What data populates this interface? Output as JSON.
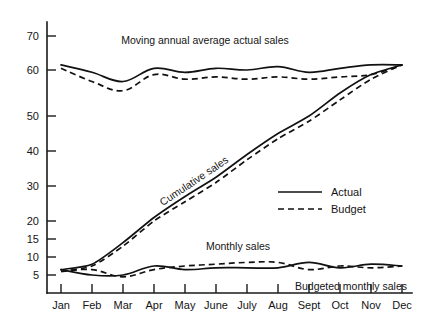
{
  "chart_data": {
    "type": "line",
    "title": "",
    "subtitle": "",
    "xlabel": "",
    "ylabel": "",
    "grid": false,
    "legend_position": "center-right",
    "categories": [
      "Jan",
      "Feb",
      "Mar",
      "Apr",
      "May",
      "June",
      "July",
      "Aug",
      "Sept",
      "Oct",
      "Nov",
      "Dec"
    ],
    "x": [
      1,
      2,
      3,
      4,
      5,
      6,
      7,
      8,
      9,
      10,
      11,
      12
    ],
    "ylim": [
      0,
      73
    ],
    "y_ticks": [
      5,
      10,
      15,
      20,
      30,
      40,
      50,
      60,
      70
    ],
    "y_tick_labels": [
      "5",
      "10",
      "15",
      "20",
      "30",
      "40",
      "50",
      "60",
      "70"
    ],
    "y_axis_scale_note": "piecewise: 5-unit steps below 20, 10-unit steps above 20",
    "series": [
      {
        "name": "Moving annual average actual sales",
        "group": "moving-annual-average",
        "style": "Actual",
        "line": "solid",
        "values": [
          61.5,
          59.5,
          57.5,
          60.5,
          59.5,
          60.5,
          60.0,
          61.0,
          59.5,
          60.5,
          61.5,
          61.5
        ]
      },
      {
        "name": "Moving annual average budget sales",
        "group": "moving-annual-average",
        "style": "Budget",
        "line": "dashed",
        "values": [
          60.5,
          57.5,
          55.5,
          59.0,
          58.0,
          58.5,
          58.0,
          58.5,
          58.0,
          58.5,
          59.0,
          61.5
        ]
      },
      {
        "name": "Cumulative actual sales",
        "group": "cumulative",
        "style": "Actual",
        "line": "solid",
        "values": [
          6.5,
          8.0,
          14.0,
          21.0,
          27.0,
          32.5,
          39.0,
          45.0,
          50.0,
          55.0,
          59.0,
          61.5
        ]
      },
      {
        "name": "Cumulative budget sales",
        "group": "cumulative",
        "style": "Budget",
        "line": "dashed",
        "values": [
          6.0,
          7.5,
          13.0,
          20.0,
          25.5,
          31.0,
          37.5,
          43.5,
          48.5,
          53.5,
          58.0,
          61.5
        ]
      },
      {
        "name": "Monthly sales",
        "group": "monthly",
        "style": "Actual",
        "line": "solid",
        "values": [
          6.5,
          5.0,
          5.0,
          7.5,
          6.5,
          7.0,
          7.0,
          7.0,
          8.5,
          7.0,
          8.0,
          7.5
        ]
      },
      {
        "name": "Budgeted monthly sales",
        "group": "monthly",
        "style": "Budget",
        "line": "dashed",
        "values": [
          6.0,
          6.5,
          4.5,
          6.5,
          7.5,
          8.0,
          8.5,
          8.5,
          6.5,
          7.5,
          7.0,
          7.5
        ]
      }
    ],
    "annotations": [
      {
        "id": "moving-annual-average-label",
        "text": "Moving annual average actual sales",
        "x": 205,
        "y": 44,
        "rotation": 0
      },
      {
        "id": "cumulative-sales-label",
        "text": "Cumulative sales",
        "x": 196,
        "y": 184,
        "rotation": -34
      },
      {
        "id": "monthly-sales-label",
        "text": "Monthly sales",
        "x": 238,
        "y": 250,
        "rotation": 0
      },
      {
        "id": "budgeted-monthly-sales-label",
        "text": "Budgeted monthly sales",
        "x": 351,
        "y": 290,
        "rotation": 0
      }
    ],
    "legend": [
      {
        "label": "Actual",
        "line": "solid"
      },
      {
        "label": "Budget",
        "line": "dashed"
      }
    ]
  },
  "colors": {
    "ink": "#111111",
    "background": "#ffffff",
    "axis": "#1a1a1a"
  }
}
